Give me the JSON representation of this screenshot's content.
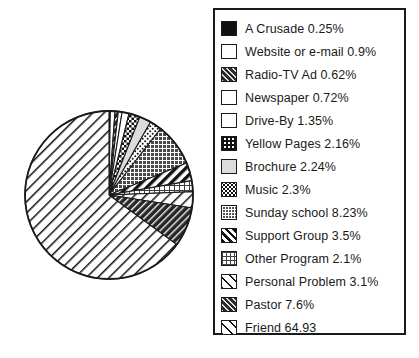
{
  "chart_data": {
    "type": "pie",
    "title": "",
    "legend_position": "right",
    "start_angle_deg": 0,
    "direction": "clockwise",
    "units": "percent",
    "categories": [
      "A Crusade",
      "Website or e-mail",
      "Radio-TV Ad",
      "Newspaper",
      "Drive-By",
      "Yellow Pages",
      "Brochure",
      "Music",
      "Sunday school",
      "Support Group",
      "Other Program",
      "Personal Problem",
      "Pastor",
      "Friend"
    ],
    "values": [
      0.25,
      0.9,
      0.62,
      0.72,
      1.35,
      2.16,
      2.24,
      2.3,
      8.23,
      3.5,
      2.1,
      3.1,
      7.6,
      64.93
    ],
    "value_labels": [
      "0.25%",
      "0.9%",
      "0.62%",
      "0.72%",
      "1.35%",
      "2.16%",
      "2.24%",
      "2.3%",
      "8.23%",
      "3.5%",
      "2.1%",
      "3.1%",
      "7.6%",
      "64.93"
    ],
    "slices": [
      {
        "label": "A Crusade",
        "value": 0.25,
        "value_label": "0.25%",
        "pattern": "solid-black"
      },
      {
        "label": "Website or e-mail",
        "value": 0.9,
        "value_label": "0.9%",
        "pattern": "white"
      },
      {
        "label": "Radio-TV Ad",
        "value": 0.62,
        "value_label": "0.62%",
        "pattern": "dark-hatch"
      },
      {
        "label": "Newspaper",
        "value": 0.72,
        "value_label": "0.72%",
        "pattern": "white"
      },
      {
        "label": "Drive-By",
        "value": 1.35,
        "value_label": "1.35%",
        "pattern": "white"
      },
      {
        "label": "Yellow Pages",
        "value": 2.16,
        "value_label": "2.16%",
        "pattern": "check"
      },
      {
        "label": "Brochure",
        "value": 2.24,
        "value_label": "2.24%",
        "pattern": "lightgray"
      },
      {
        "label": "Music",
        "value": 2.3,
        "value_label": "2.3%",
        "pattern": "speckle"
      },
      {
        "label": "Sunday school",
        "value": 8.23,
        "value_label": "8.23%",
        "pattern": "grid"
      },
      {
        "label": "Support Group",
        "value": 3.5,
        "value_label": "3.5%",
        "pattern": "thickdiag"
      },
      {
        "label": "Other Program",
        "value": 2.1,
        "value_label": "2.1%",
        "pattern": "dotgrid"
      },
      {
        "label": "Personal Problem",
        "value": 3.1,
        "value_label": "3.1%",
        "pattern": "diag"
      },
      {
        "label": "Pastor",
        "value": 7.6,
        "value_label": "7.6%",
        "pattern": "dark-hatch"
      },
      {
        "label": "Friend",
        "value": 64.93,
        "value_label": "64.93",
        "pattern": "diag"
      }
    ]
  },
  "legend": {
    "entries": [
      {
        "text": "A Crusade 0.25%",
        "pattern": "p-solid-black"
      },
      {
        "text": "Website or e-mail 0.9%",
        "pattern": "p-white"
      },
      {
        "text": "Radio-TV Ad 0.62%",
        "pattern": "p-dark-hatch"
      },
      {
        "text": "Newspaper 0.72%",
        "pattern": "p-white"
      },
      {
        "text": "Drive-By  1.35%",
        "pattern": "p-white"
      },
      {
        "text": "Yellow Pages 2.16%",
        "pattern": "p-check"
      },
      {
        "text": "Brochure 2.24%",
        "pattern": "p-lightgray"
      },
      {
        "text": "Music 2.3%",
        "pattern": "p-speckle"
      },
      {
        "text": "Sunday school 8.23%",
        "pattern": "p-grid"
      },
      {
        "text": "Support Group 3.5%",
        "pattern": "p-thickdiag"
      },
      {
        "text": "Other Program 2.1%",
        "pattern": "p-dotgrid"
      },
      {
        "text": "Personal Problem 3.1%",
        "pattern": "p-diag"
      },
      {
        "text": "Pastor  7.6%",
        "pattern": "p-dark-hatch"
      },
      {
        "text": "Friend  64.93",
        "pattern": "p-diag"
      }
    ]
  },
  "colors": {
    "outline": "#1a1a1a",
    "background": "#ffffff",
    "text": "#1a1a1a"
  }
}
